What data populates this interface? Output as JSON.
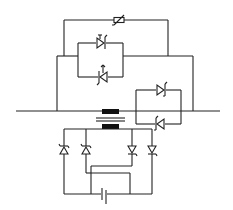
{
  "diagram": {
    "type": "circuit-schematic",
    "description": "Transformer-coupled thyristor switching circuit with varistor, anti-parallel thyristor pairs and a diode bridge feeding a capacitor",
    "colors": {
      "line": "#222222",
      "core": "#111111",
      "background": "#ffffff"
    },
    "components": [
      {
        "id": "varistor",
        "label": "Varistor",
        "position": "top"
      },
      {
        "id": "thyristor-upper-left",
        "label": "Thyristor",
        "position": "upper-left pair, top"
      },
      {
        "id": "thyristor-lower-left",
        "label": "Thyristor",
        "position": "upper-left pair, bottom"
      },
      {
        "id": "thyristor-upper-right",
        "label": "Thyristor",
        "position": "right pair, top"
      },
      {
        "id": "thyristor-lower-right",
        "label": "Thyristor",
        "position": "right pair, bottom"
      },
      {
        "id": "transformer",
        "label": "Transformer",
        "position": "center"
      },
      {
        "id": "bridge-diode-1",
        "label": "Diode",
        "position": "bridge, leftmost"
      },
      {
        "id": "bridge-diode-2",
        "label": "Diode",
        "position": "bridge, second"
      },
      {
        "id": "bridge-diode-3",
        "label": "Diode",
        "position": "bridge, third"
      },
      {
        "id": "bridge-diode-4",
        "label": "Diode",
        "position": "bridge, rightmost"
      },
      {
        "id": "capacitor",
        "label": "Capacitor",
        "position": "bottom"
      }
    ]
  }
}
